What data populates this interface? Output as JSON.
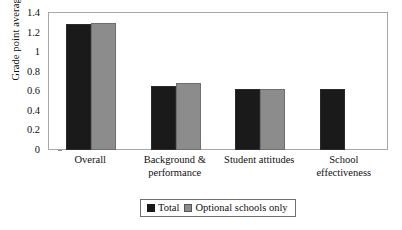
{
  "chart_data": {
    "type": "bar",
    "title": "",
    "subtitle": "",
    "xlabel": "",
    "ylabel": "Grade point average",
    "ylim": [
      0,
      1.4
    ],
    "yticks": [
      "0",
      "0.2",
      "0.4",
      "0.6",
      "0.8",
      "1",
      "1.2",
      "1.4"
    ],
    "ytick_values": [
      0,
      0.2,
      0.4,
      0.6,
      0.8,
      1.0,
      1.2,
      1.4
    ],
    "grid": false,
    "legend_position": "bottom",
    "categories": [
      "Overall",
      "Background & performance",
      "Student attitudes",
      "School effectiveness"
    ],
    "series": [
      {
        "name": "Total",
        "color": "#1a1a1a",
        "values": [
          1.29,
          0.65,
          0.62,
          0.625
        ]
      },
      {
        "name": "Optional schools only",
        "color": "#8c8c8c",
        "values": [
          1.3,
          0.68,
          0.625,
          null
        ]
      }
    ]
  },
  "axis": {
    "y_title": "Grade point average"
  },
  "legend": {
    "items": [
      {
        "label": "Total"
      },
      {
        "label": "Optional schools only"
      }
    ]
  },
  "colors": {
    "total": "#1a1a1a",
    "optional": "#8c8c8c",
    "frame": "#a8a8a8",
    "background": "#ffffff"
  }
}
